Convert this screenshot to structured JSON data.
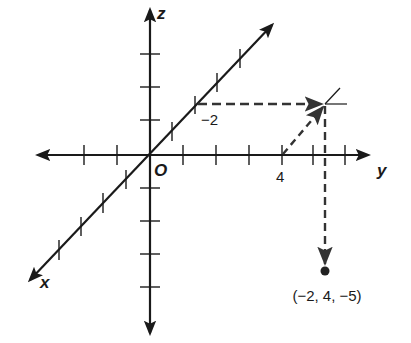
{
  "diagram": {
    "axes": {
      "x_label": "x",
      "y_label": "y",
      "z_label": "z",
      "origin_label": "O"
    },
    "tick_labels": {
      "x": "−2",
      "y": "4"
    },
    "point": {
      "x": -2,
      "y": 4,
      "z": -5,
      "label": "(−2, 4, −5)"
    },
    "path_steps": [
      "move -2 units along x axis",
      "move 4 units parallel to y axis",
      "move -5 units parallel to z axis"
    ],
    "colors": {
      "ink": "#1a1a1a",
      "dash": "#333333"
    }
  }
}
